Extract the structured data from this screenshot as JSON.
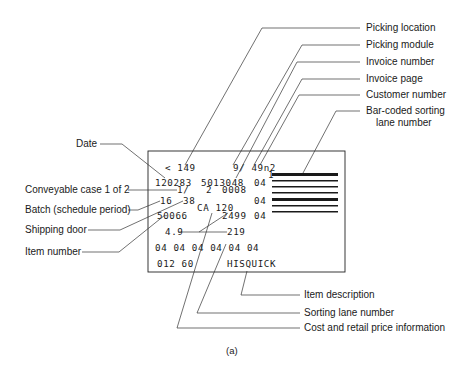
{
  "diagram": {
    "caption": "(a)",
    "callouts_right": {
      "picking_location": "Picking location",
      "picking_module": "Picking module",
      "invoice_number": "Invoice number",
      "invoice_page": "Invoice page",
      "customer_number": "Customer number",
      "barcoded_lane_1": "Bar-coded sorting",
      "barcoded_lane_2": "lane number"
    },
    "callouts_left": {
      "date": "Date",
      "conveyable_case": "Conveyable case 1 of 2",
      "batch": "Batch (schedule period)",
      "shipping_door": "Shipping door",
      "item_number": "Item number"
    },
    "callouts_bottom": {
      "item_description": "Item description",
      "sorting_lane_number": "Sorting lane number",
      "cost_retail": "Cost and retail price information"
    },
    "label": {
      "row1_a": "< 149",
      "row1_b": "9/ 49n2",
      "row1_c": "1",
      "row2_a": "120283",
      "row2_b": "5013048",
      "row2_c": "04",
      "row3_a": "1/",
      "row3_b": "2",
      "row3_c": "0008",
      "row4_a": "16",
      "row4_b": "38",
      "row4_c": "04",
      "row5_a": "CA 120",
      "row6_a": "50066",
      "row6_b": "2499",
      "row6_c": "04",
      "row7_a": "4.9",
      "row7_b": "219",
      "row8": "04 04 04 04 04 04",
      "row9_a": "012 60",
      "row9_b": "HISQUICK"
    }
  }
}
